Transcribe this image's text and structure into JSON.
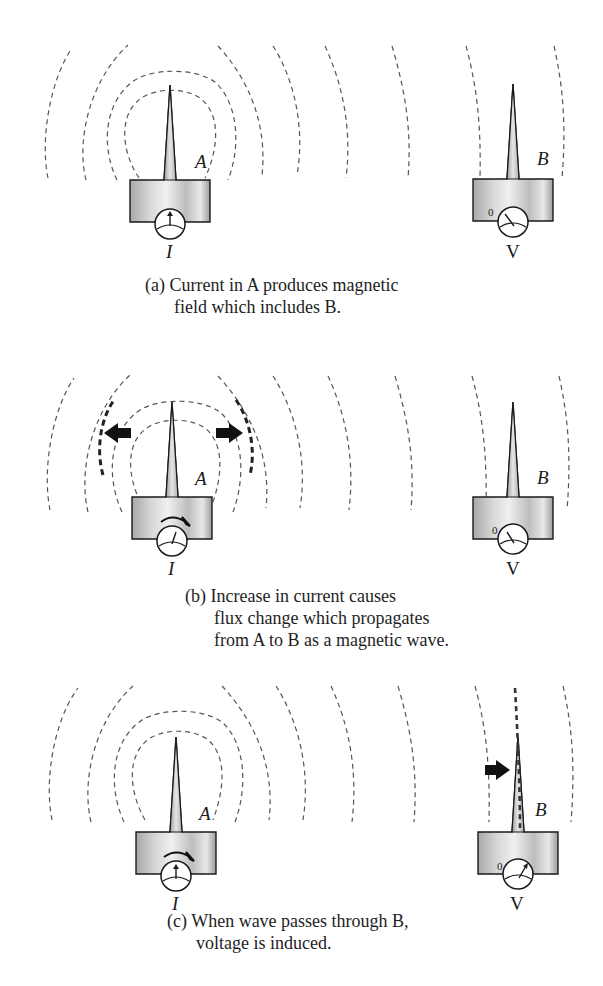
{
  "figure": {
    "panels": [
      {
        "id": "a",
        "caption_lines": [
          "(a) Current in A produces magnetic",
          "field which includes B."
        ],
        "transmitter_label": "A",
        "receiver_label": "B",
        "current_label": "I",
        "voltage_label": "V",
        "zero_label": "0",
        "arrows": [],
        "current_increasing": false,
        "voltage_induced": false
      },
      {
        "id": "b",
        "caption_lines": [
          "(b) Increase in current causes",
          "flux change which propagates",
          "from A to B as a magnetic wave."
        ],
        "transmitter_label": "A",
        "receiver_label": "B",
        "current_label": "I",
        "voltage_label": "V",
        "zero_label": "0",
        "arrows": [
          "left-outward",
          "right-outward"
        ],
        "current_increasing": true,
        "voltage_induced": false
      },
      {
        "id": "c",
        "caption_lines": [
          "(c) When wave passes through B,",
          "voltage is induced."
        ],
        "transmitter_label": "A",
        "receiver_label": "B",
        "current_label": "I",
        "voltage_label": "V",
        "zero_label": "0",
        "arrows": [
          "right-at-receiver"
        ],
        "current_increasing": true,
        "voltage_induced": true
      }
    ],
    "colors": {
      "field_line": "#555555",
      "antenna_fill_dark": "#9a9a9a",
      "antenna_fill_light": "#e6e6e6",
      "outline": "#1a1a1a",
      "arrow": "#111111"
    }
  }
}
